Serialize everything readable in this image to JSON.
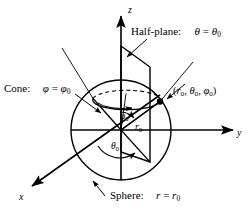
{
  "figure": {
    "axes": {
      "z_label": "z",
      "y_label": "y",
      "x_label": "x"
    },
    "labels": {
      "halfplane_name": "Half-plane:",
      "halfplane_eq_lhs": "θ",
      "halfplane_eq_op": " = ",
      "halfplane_eq_rhs": "θ",
      "halfplane_eq_sub": "0",
      "cone_name": "Cone:",
      "cone_eq_lhs": "φ",
      "cone_eq_op": " = ",
      "cone_eq_rhs": "φ",
      "cone_eq_sub": "0",
      "sphere_name": "Sphere:",
      "sphere_eq_lhs": "r",
      "sphere_eq_op": " = ",
      "sphere_eq_rhs": "r",
      "sphere_eq_sub": "0",
      "point_open": "(",
      "point_r": "r",
      "point_r_sub": "0",
      "point_sep1": ", ",
      "point_theta": "θ",
      "point_theta_sub": "0",
      "point_sep2": ", ",
      "point_phi": "φ",
      "point_phi_sub": "0",
      "point_close": ")",
      "phi0_sym": "φ",
      "phi0_sub": "0",
      "r0_sym": "r",
      "r0_sub": "0",
      "theta0_sym": "θ",
      "theta0_sub": "0"
    },
    "colors": {
      "stroke": "#000000",
      "background": "#ffffff"
    }
  }
}
